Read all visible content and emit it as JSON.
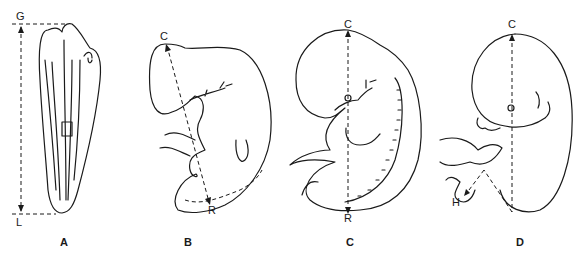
{
  "panels": [
    {
      "id": "A",
      "label": "A",
      "top_marker": "G",
      "bottom_marker": "L",
      "measurement": "greatest length"
    },
    {
      "id": "B",
      "label": "B",
      "top_marker": "C",
      "bottom_marker": "R",
      "measurement": "crown-rump length"
    },
    {
      "id": "C",
      "label": "C",
      "top_marker": "C",
      "bottom_marker": "R",
      "measurement": "crown-rump length"
    },
    {
      "id": "D",
      "label": "D",
      "top_marker": "C",
      "bottom_marker": "H",
      "measurement": "crown-heel length"
    }
  ],
  "colors": {
    "ink": "#1a1a1a",
    "background": "#ffffff"
  }
}
